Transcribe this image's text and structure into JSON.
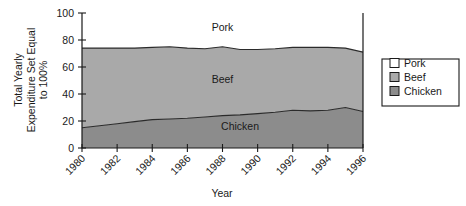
{
  "chart_data": {
    "type": "area",
    "title": "",
    "subtitle": "",
    "stacked": true,
    "normalized": true,
    "xlabel": "Year",
    "ylabel": "Total Yearly Expenditure Set Equal to 100%",
    "ylabel_line1": "Total Yearly",
    "ylabel_line2": "Expenditure Set Equal",
    "ylabel_line3": "to 100%",
    "xlim": [
      1980,
      1996
    ],
    "ylim": [
      0,
      100
    ],
    "yticks": [
      0,
      20,
      40,
      60,
      80,
      100
    ],
    "ytick_labels": [
      "0",
      "20",
      "40",
      "60",
      "80",
      "100"
    ],
    "xticks": [
      1980,
      1982,
      1984,
      1986,
      1988,
      1990,
      1992,
      1994,
      1996
    ],
    "xtick_labels": [
      "1980",
      "1982",
      "1984",
      "1986",
      "1988",
      "1990",
      "1992",
      "1994",
      "1996"
    ],
    "xtick_rotation": 45,
    "grid": false,
    "legend_position": "right",
    "x": [
      1980,
      1981,
      1982,
      1983,
      1984,
      1985,
      1986,
      1987,
      1988,
      1989,
      1990,
      1991,
      1992,
      1993,
      1994,
      1995,
      1996
    ],
    "series": [
      {
        "name": "Chicken",
        "color": "#8c8c8c",
        "order": "bottom",
        "values": [
          15,
          16.5,
          18,
          19.5,
          21,
          21.5,
          22,
          23,
          24,
          24.5,
          25.5,
          26.5,
          28,
          27.5,
          28,
          30,
          27
        ]
      },
      {
        "name": "Beef",
        "color": "#a9a9a9",
        "order": "middle",
        "values": [
          59,
          57.5,
          56,
          54.5,
          53.5,
          53.5,
          52,
          50.5,
          51,
          48.5,
          47.5,
          47,
          46.5,
          47,
          46.5,
          44,
          44
        ]
      },
      {
        "name": "Pork",
        "color": "#ffffff",
        "order": "top",
        "values": [
          26,
          26,
          26,
          26,
          25.5,
          25,
          26,
          26.5,
          25,
          27,
          27,
          26.5,
          25.5,
          25.5,
          25.5,
          26,
          29
        ]
      }
    ],
    "cumulative_chicken_top": [
      15,
      16.5,
      18,
      19.5,
      21,
      21.5,
      22,
      23,
      24,
      24.5,
      25.5,
      26.5,
      28,
      27.5,
      28,
      30,
      27
    ],
    "cumulative_beef_top": [
      74,
      74,
      74,
      74,
      74.5,
      75,
      74,
      73.5,
      75,
      73,
      73,
      73.5,
      74.5,
      74.5,
      74.5,
      74,
      71
    ],
    "annotations": [
      {
        "text": "Pork",
        "x": 1988,
        "y": 87
      },
      {
        "text": "Beef",
        "x": 1988,
        "y": 48
      },
      {
        "text": "Chicken",
        "x": 1989,
        "y": 13
      }
    ],
    "legend_entries": [
      {
        "label": "Pork",
        "color": "#ffffff"
      },
      {
        "label": "Beef",
        "color": "#a9a9a9"
      },
      {
        "label": "Chicken",
        "color": "#8c8c8c"
      }
    ]
  }
}
